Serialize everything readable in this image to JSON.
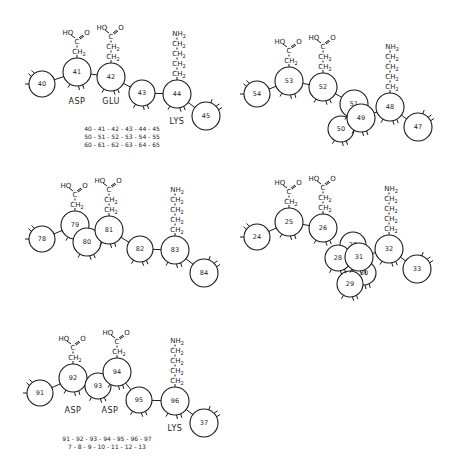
{
  "colors": {
    "ink": "#1a1a1a",
    "background": "#ffffff"
  },
  "panels": [
    {
      "id": "panel-1",
      "residues": [
        {
          "n": "40",
          "x": 42,
          "y": 84,
          "r": 13
        },
        {
          "n": "41",
          "x": 77,
          "y": 72,
          "r": 14
        },
        {
          "n": "42",
          "x": 111,
          "y": 77,
          "r": 14
        },
        {
          "n": "43",
          "x": 142,
          "y": 93,
          "r": 13
        },
        {
          "n": "44",
          "x": 177,
          "y": 94,
          "r": 14
        },
        {
          "n": "45",
          "x": 206,
          "y": 116,
          "r": 14
        }
      ],
      "bonds": [
        [
          0,
          1
        ],
        [
          1,
          2
        ],
        [
          2,
          3
        ],
        [
          3,
          4
        ],
        [
          4,
          5
        ]
      ],
      "side_chains": [
        {
          "type": "acid",
          "residue": 1,
          "ch2": 1
        },
        {
          "type": "acid",
          "residue": 2,
          "ch2": 2
        },
        {
          "type": "amine",
          "residue": 4,
          "ch2": 4
        }
      ],
      "labels": [
        {
          "text": "ASP",
          "x": 77,
          "y": 104
        },
        {
          "text": "GLU",
          "x": 111,
          "y": 104
        },
        {
          "text": "LYS",
          "x": 177,
          "y": 124
        }
      ],
      "sequences": [
        {
          "text": "40 - 41 - 42 - 43 - 44 - 45",
          "x": 122,
          "y": 131
        },
        {
          "text": "50 - 51 - 52 - 53 - 54 - 55",
          "x": 122,
          "y": 139
        },
        {
          "text": "60 - 61 - 62 - 63 - 64 - 65",
          "x": 122,
          "y": 147
        }
      ]
    },
    {
      "id": "panel-2",
      "residues": [
        {
          "n": "54",
          "x": 257,
          "y": 94,
          "r": 13
        },
        {
          "n": "53",
          "x": 289,
          "y": 81,
          "r": 14
        },
        {
          "n": "52",
          "x": 323,
          "y": 87,
          "r": 14
        },
        {
          "n": "50",
          "x": 341,
          "y": 129,
          "r": 13
        },
        {
          "n": "51",
          "x": 354,
          "y": 104,
          "r": 14
        },
        {
          "n": "49",
          "x": 361,
          "y": 118,
          "r": 14
        },
        {
          "n": "48",
          "x": 390,
          "y": 107,
          "r": 14
        },
        {
          "n": "47",
          "x": 418,
          "y": 127,
          "r": 14
        }
      ],
      "bonds": [
        [
          0,
          1
        ],
        [
          1,
          2
        ],
        [
          2,
          4
        ],
        [
          5,
          6
        ],
        [
          6,
          7
        ]
      ],
      "side_chains": [
        {
          "type": "acid",
          "residue": 1,
          "ch2": 1
        },
        {
          "type": "acid",
          "residue": 2,
          "ch2": 2
        },
        {
          "type": "amine",
          "residue": 6,
          "ch2": 4
        }
      ],
      "labels": [],
      "sequences": []
    },
    {
      "id": "panel-3",
      "residues": [
        {
          "n": "78",
          "x": 42,
          "y": 239,
          "r": 13
        },
        {
          "n": "79",
          "x": 75,
          "y": 225,
          "r": 14
        },
        {
          "n": "80",
          "x": 87,
          "y": 242,
          "r": 14
        },
        {
          "n": "81",
          "x": 109,
          "y": 230,
          "r": 14
        },
        {
          "n": "82",
          "x": 140,
          "y": 249,
          "r": 13
        },
        {
          "n": "83",
          "x": 175,
          "y": 250,
          "r": 14
        },
        {
          "n": "84",
          "x": 204,
          "y": 273,
          "r": 14
        }
      ],
      "bonds": [
        [
          0,
          1
        ],
        [
          2,
          3
        ],
        [
          3,
          4
        ],
        [
          4,
          5
        ],
        [
          5,
          6
        ]
      ],
      "side_chains": [
        {
          "type": "acid",
          "residue": 1,
          "ch2": 1
        },
        {
          "type": "acid",
          "residue": 3,
          "ch2": 2
        },
        {
          "type": "amine",
          "residue": 5,
          "ch2": 4
        }
      ],
      "labels": [],
      "sequences": []
    },
    {
      "id": "panel-4",
      "residues": [
        {
          "n": "24",
          "x": 257,
          "y": 237,
          "r": 13
        },
        {
          "n": "25",
          "x": 289,
          "y": 222,
          "r": 14
        },
        {
          "n": "26",
          "x": 323,
          "y": 228,
          "r": 14
        },
        {
          "n": "30",
          "x": 364,
          "y": 273,
          "r": 12
        },
        {
          "n": "29",
          "x": 350,
          "y": 284,
          "r": 13
        },
        {
          "n": "27",
          "x": 353,
          "y": 245,
          "r": 13
        },
        {
          "n": "28",
          "x": 338,
          "y": 258,
          "r": 13
        },
        {
          "n": "31",
          "x": 359,
          "y": 257,
          "r": 14
        },
        {
          "n": "32",
          "x": 389,
          "y": 249,
          "r": 14
        },
        {
          "n": "33",
          "x": 417,
          "y": 269,
          "r": 14
        }
      ],
      "bonds": [
        [
          0,
          1
        ],
        [
          1,
          2
        ],
        [
          7,
          8
        ],
        [
          8,
          9
        ]
      ],
      "side_chains": [
        {
          "type": "acid",
          "residue": 1,
          "ch2": 1
        },
        {
          "type": "acid",
          "residue": 2,
          "ch2": 2
        },
        {
          "type": "amine",
          "residue": 8,
          "ch2": 4
        }
      ],
      "labels": [],
      "sequences": []
    },
    {
      "id": "panel-5",
      "residues": [
        {
          "n": "91",
          "x": 40,
          "y": 393,
          "r": 13
        },
        {
          "n": "92",
          "x": 73,
          "y": 378,
          "r": 14
        },
        {
          "n": "93",
          "x": 98,
          "y": 386,
          "r": 13
        },
        {
          "n": "94",
          "x": 117,
          "y": 372,
          "r": 14
        },
        {
          "n": "95",
          "x": 139,
          "y": 400,
          "r": 13
        },
        {
          "n": "96",
          "x": 175,
          "y": 401,
          "r": 14
        },
        {
          "n": "37",
          "x": 204,
          "y": 423,
          "r": 14
        }
      ],
      "bonds": [
        [
          0,
          1
        ],
        [
          1,
          2
        ],
        [
          3,
          4
        ],
        [
          4,
          5
        ],
        [
          5,
          6
        ]
      ],
      "side_chains": [
        {
          "type": "acid",
          "residue": 1,
          "ch2": 1
        },
        {
          "type": "acid",
          "residue": 3,
          "ch2": 1
        },
        {
          "type": "amine",
          "residue": 5,
          "ch2": 4
        }
      ],
      "labels": [
        {
          "text": "ASP",
          "x": 73,
          "y": 413
        },
        {
          "text": "ASP",
          "x": 110,
          "y": 413
        },
        {
          "text": "LYS",
          "x": 175,
          "y": 431
        }
      ],
      "sequences": [
        {
          "text": "91 - 92 - 93 - 94 - 95 - 96 - 97",
          "x": 107,
          "y": 441
        },
        {
          "text": "7 - 8 - 9 - 10 - 11 - 12 - 13",
          "x": 107,
          "y": 449
        }
      ]
    }
  ],
  "chem_text": {
    "acid_oh": "HO",
    "acid_c": "C",
    "acid_o": "O",
    "ch2": "CH",
    "sub2": "2",
    "nh2": "NH"
  }
}
